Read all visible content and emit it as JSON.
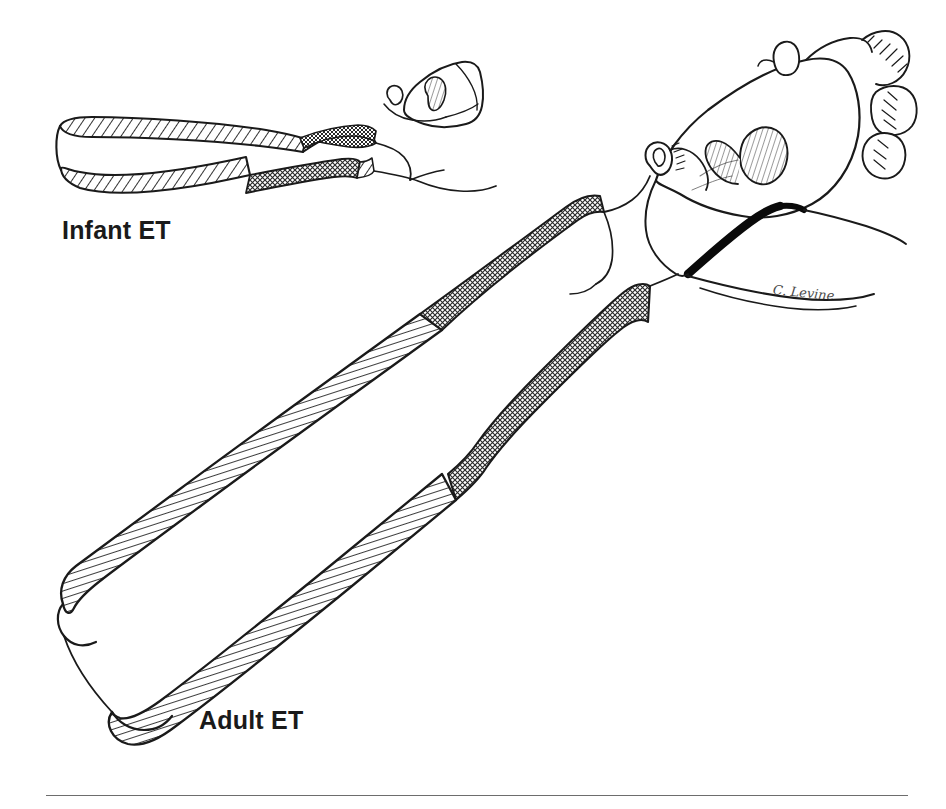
{
  "figure": {
    "background_color": "#ffffff",
    "ink_color": "#1a1a1a",
    "width": 946,
    "height": 809
  },
  "labels": {
    "infant": "Infant ET",
    "adult": "Adult ET"
  },
  "signature": {
    "text": "C. Levine"
  },
  "legend_textures": {
    "bony_portion": "diagonal-hatch",
    "cartilaginous_portion": "stipple-crosshatch",
    "levator_muscle": "solid-black-band"
  },
  "structures": {
    "infant_tube_angle_degrees": 10,
    "adult_tube_angle_degrees": 45,
    "nasopharynx": "skull-base-and-nasopharynx-outline",
    "adenoid_masses": 4
  },
  "rule": {
    "present": true
  }
}
